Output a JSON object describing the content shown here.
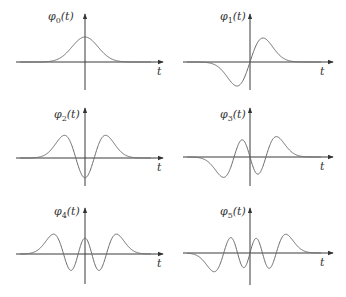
{
  "figure": {
    "axis_label": "t",
    "panels": [
      {
        "order": 0,
        "label": "φ",
        "subscript": "0",
        "arg": "(t)",
        "x_axis_y": 62,
        "x_start": 16,
        "x_end": 163,
        "y_axis_x": 85,
        "y_top": 14,
        "y_bottom": 90,
        "label_x": 48,
        "label_y": 20,
        "t_x": 157,
        "t_y": 75,
        "x_scale": 13,
        "amp": 25
      },
      {
        "order": 1,
        "label": "φ",
        "subscript": "1",
        "arg": "(t)",
        "x_axis_y": 62,
        "x_start": 183,
        "x_end": 333,
        "y_axis_x": 250,
        "y_top": 14,
        "y_bottom": 90,
        "label_x": 220,
        "label_y": 20,
        "t_x": 320,
        "t_y": 75,
        "x_scale": 13,
        "amp": 28
      },
      {
        "order": 2,
        "label": "φ",
        "subscript": "2",
        "arg": "(t)",
        "x_axis_y": 158,
        "x_start": 16,
        "x_end": 163,
        "y_axis_x": 85,
        "y_top": 108,
        "y_bottom": 186,
        "label_x": 54,
        "label_y": 118,
        "t_x": 157,
        "t_y": 171,
        "x_scale": 13,
        "amp": 28
      },
      {
        "order": 3,
        "label": "φ",
        "subscript": "3",
        "arg": "(t)",
        "x_axis_y": 157,
        "x_start": 183,
        "x_end": 333,
        "y_axis_x": 250,
        "y_top": 108,
        "y_bottom": 186,
        "label_x": 220,
        "label_y": 118,
        "t_x": 320,
        "t_y": 170,
        "x_scale": 13,
        "amp": 26
      },
      {
        "order": 4,
        "label": "φ",
        "subscript": "4",
        "arg": "(t)",
        "x_axis_y": 254,
        "x_start": 16,
        "x_end": 163,
        "y_axis_x": 85,
        "y_top": 208,
        "y_bottom": 284,
        "label_x": 54,
        "label_y": 215,
        "t_x": 157,
        "t_y": 267,
        "x_scale": 13,
        "amp": 26
      },
      {
        "order": 5,
        "label": "φ",
        "subscript": "5",
        "arg": "(t)",
        "x_axis_y": 253,
        "x_start": 183,
        "x_end": 333,
        "y_axis_x": 250,
        "y_top": 208,
        "y_bottom": 285,
        "label_x": 220,
        "label_y": 215,
        "t_x": 320,
        "t_y": 266,
        "x_scale": 13,
        "amp": 25
      }
    ]
  },
  "colors": {
    "axis": "#3a3a3a",
    "curve": "#6a6a6a",
    "background": "#ffffff"
  }
}
